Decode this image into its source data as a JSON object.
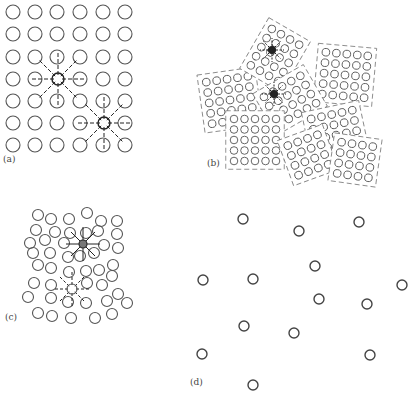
{
  "figure": {
    "stroke_color": "#555555",
    "defect_color": "#222222",
    "panels": [
      {
        "id": "a",
        "label": "(a)",
        "description": "perfect crystal lattice with two point defects"
      },
      {
        "id": "b",
        "label": "(b)",
        "description": "polycrystalline grains with grain boundaries and defects"
      },
      {
        "id": "c",
        "label": "(c)",
        "description": "amorphous / disordered arrangement with defects"
      },
      {
        "id": "d",
        "label": "(d)",
        "description": "dilute random arrangement (gas-like)"
      }
    ]
  },
  "panel_a": {
    "cols": [
      13,
      35,
      57,
      80,
      103,
      125
    ],
    "rows": [
      12,
      34,
      57,
      79,
      101,
      123,
      145
    ],
    "r": 7,
    "defects": [
      [
        58,
        79
      ],
      [
        104,
        123
      ]
    ]
  },
  "panel_c": {
    "r": 5.5,
    "points": [
      [
        38,
        215
      ],
      [
        51,
        219
      ],
      [
        69,
        219
      ],
      [
        87,
        213
      ],
      [
        101,
        221
      ],
      [
        117,
        221
      ],
      [
        36,
        230
      ],
      [
        55,
        232
      ],
      [
        70,
        233
      ],
      [
        86,
        233
      ],
      [
        98,
        231
      ],
      [
        117,
        234
      ],
      [
        30,
        243
      ],
      [
        45,
        240
      ],
      [
        64,
        243
      ],
      [
        104,
        245
      ],
      [
        118,
        248
      ],
      [
        33,
        253
      ],
      [
        50,
        253
      ],
      [
        68,
        257
      ],
      [
        80,
        256
      ],
      [
        94,
        253
      ],
      [
        38,
        265
      ],
      [
        51,
        268
      ],
      [
        69,
        272
      ],
      [
        86,
        271
      ],
      [
        99,
        270
      ],
      [
        113,
        265
      ],
      [
        34,
        283
      ],
      [
        51,
        285
      ],
      [
        87,
        283
      ],
      [
        102,
        285
      ],
      [
        112,
        276
      ],
      [
        28,
        297
      ],
      [
        51,
        298
      ],
      [
        68,
        302
      ],
      [
        86,
        303
      ],
      [
        107,
        301
      ],
      [
        118,
        294
      ],
      [
        127,
        303
      ],
      [
        38,
        313
      ],
      [
        52,
        316
      ],
      [
        71,
        318
      ],
      [
        95,
        318
      ],
      [
        112,
        314
      ]
    ],
    "defects": [
      [
        83,
        244
      ],
      [
        72,
        289
      ]
    ]
  },
  "panel_d": {
    "r": 5,
    "points": [
      [
        243,
        219
      ],
      [
        299,
        231
      ],
      [
        359,
        222
      ],
      [
        203,
        280
      ],
      [
        253,
        279
      ],
      [
        315,
        266
      ],
      [
        402,
        285
      ],
      [
        319,
        299
      ],
      [
        367,
        304
      ],
      [
        244,
        326
      ],
      [
        294,
        333
      ],
      [
        202,
        354
      ],
      [
        370,
        355
      ],
      [
        253,
        385
      ]
    ]
  }
}
